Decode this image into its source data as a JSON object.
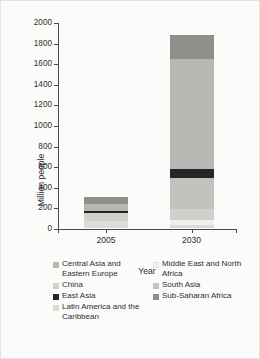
{
  "chart_data": {
    "type": "bar",
    "title": "",
    "subtitle": "",
    "stacked": true,
    "xlabel": "Year",
    "ylabel": "Million people",
    "categories": [
      "2005",
      "2030"
    ],
    "ylim": [
      0,
      2000
    ],
    "yticks": [
      0,
      200,
      400,
      600,
      800,
      1000,
      1200,
      1400,
      1600,
      1800,
      2000
    ],
    "ytick_labels": [
      "0",
      "200",
      "400",
      "600",
      "800",
      "1000",
      "1200",
      "1400",
      "1600",
      "1800",
      "2000"
    ],
    "grid": false,
    "legend_position": "bottom",
    "series": [
      {
        "name": "Latin America and the Caribbean",
        "color": "#dcdcda",
        "values": [
          70,
          25
        ]
      },
      {
        "name": "Middle East and North Africa",
        "color": "#f0f0ee",
        "values": [
          0,
          55
        ]
      },
      {
        "name": "China",
        "color": "#d0d0cd",
        "values": [
          80,
          105
        ]
      },
      {
        "name": "South Asia",
        "color": "#c2c2bf",
        "values": [
          0,
          300
        ]
      },
      {
        "name": "East Asia",
        "color": "#262626",
        "values": [
          12,
          90
        ]
      },
      {
        "name": "Central Asia and Eastern Europe",
        "color": "#b7b7b4",
        "values": [
          75,
          1070
        ]
      },
      {
        "name": "Sub-Saharan Africa",
        "color": "#8e8e8b",
        "values": [
          63,
          225
        ]
      }
    ],
    "totals": [
      300,
      1870
    ],
    "stack_order_bottom_to_top": [
      "Latin America and the Caribbean",
      "Middle East and North Africa",
      "China",
      "South Asia",
      "East Asia",
      "Central Asia and Eastern Europe",
      "Sub-Saharan Africa"
    ]
  },
  "legend": {
    "left_column": [
      {
        "label": "Central Asia and Eastern Europe",
        "color": "#b7b7b4"
      },
      {
        "label": "China",
        "color": "#d0d0cd"
      },
      {
        "label": "East Asia",
        "color": "#262626"
      },
      {
        "label": "Latin America and the Caribbean",
        "color": "#dcdcda"
      }
    ],
    "right_column": [
      {
        "label": "Middle East and North Africa",
        "color": "#f0f0ee"
      },
      {
        "label": "South Asia",
        "color": "#c2c2bf"
      },
      {
        "label": "Sub-Saharan Africa",
        "color": "#8e8e8b"
      }
    ]
  }
}
